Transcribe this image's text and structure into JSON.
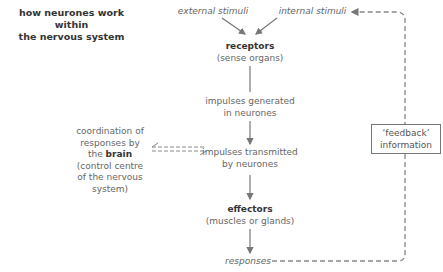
{
  "title": {
    "line1": "how neurones work within",
    "line2": "the nervous system"
  },
  "nodes": {
    "external_stimuli": "external stimuli",
    "internal_stimuli": "internal stimuli",
    "receptors": {
      "label": "receptors",
      "sub": "(sense organs)"
    },
    "impulses_generated": {
      "line1": "impulses generated",
      "line2": "in neurones"
    },
    "impulses_transmitted": {
      "line1": "impulses transmitted",
      "line2": "by neurones"
    },
    "effectors": {
      "label": "effectors",
      "sub": "(muscles or glands)"
    },
    "responses": "responses",
    "brain": {
      "line1": "coordination of",
      "line2": "responses by",
      "line3_prefix": "the ",
      "line3_bold": "brain",
      "line4": "(control centre",
      "line5": "of the nervous",
      "line6": "system)"
    },
    "feedback": {
      "line1": "‘feedback’",
      "line2": "information"
    }
  },
  "colors": {
    "arrow": "#777777",
    "text": "#666666",
    "bold_text": "#333333"
  }
}
